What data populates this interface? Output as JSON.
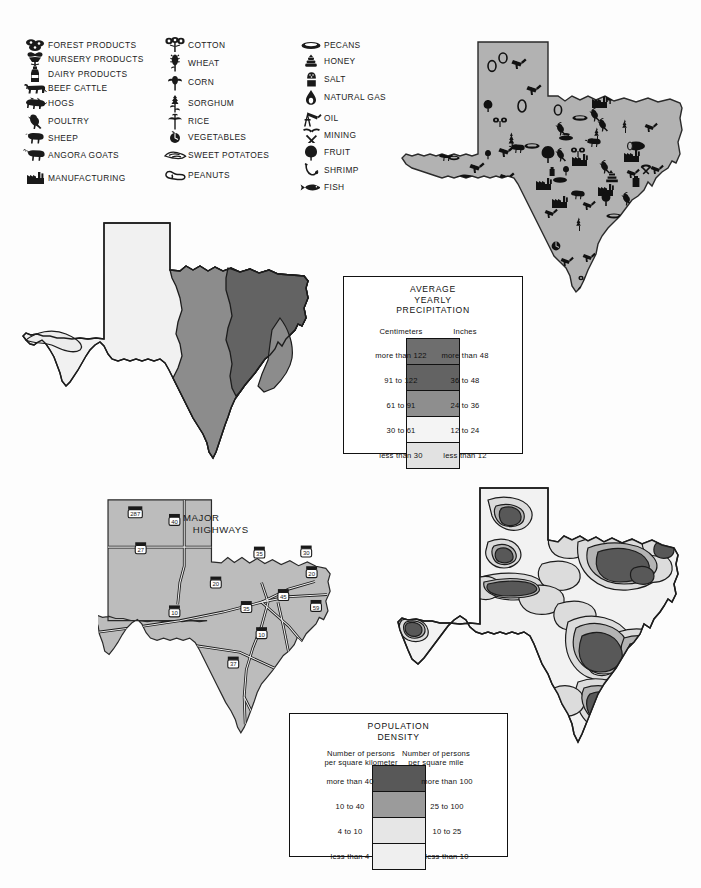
{
  "product_key": {
    "columns": [
      {
        "items": [
          {
            "icon": "forest-products-icon",
            "label": "FOREST PRODUCTS"
          },
          {
            "icon": "nursery-products-icon",
            "label": "NURSERY PRODUCTS"
          },
          {
            "icon": "dairy-products-icon",
            "label": "DAIRY PRODUCTS"
          },
          {
            "icon": "beef-cattle-icon",
            "label": "BEEF CATTLE"
          },
          {
            "icon": "hogs-icon",
            "label": "HOGS"
          },
          {
            "icon": "poultry-icon",
            "label": "POULTRY"
          },
          {
            "icon": "sheep-icon",
            "label": "SHEEP"
          },
          {
            "icon": "angora-goats-icon",
            "label": "ANGORA GOATS"
          },
          {
            "icon": "manufacturing-icon",
            "label": "MANUFACTURING"
          }
        ]
      },
      {
        "items": [
          {
            "icon": "cotton-icon",
            "label": "COTTON"
          },
          {
            "icon": "wheat-icon",
            "label": "WHEAT"
          },
          {
            "icon": "corn-icon",
            "label": "CORN"
          },
          {
            "icon": "sorghum-icon",
            "label": "SORGHUM"
          },
          {
            "icon": "rice-icon",
            "label": "RICE"
          },
          {
            "icon": "vegetables-icon",
            "label": "VEGETABLES"
          },
          {
            "icon": "sweet-potatoes-icon",
            "label": "SWEET POTATOES"
          },
          {
            "icon": "peanuts-icon",
            "label": "PEANUTS"
          }
        ]
      },
      {
        "items": [
          {
            "icon": "pecans-icon",
            "label": "PECANS"
          },
          {
            "icon": "honey-icon",
            "label": "HONEY"
          },
          {
            "icon": "salt-icon",
            "label": "SALT"
          },
          {
            "icon": "natural-gas-icon",
            "label": "NATURAL GAS"
          },
          {
            "icon": "oil-icon",
            "label": "OIL"
          },
          {
            "icon": "mining-icon",
            "label": "MINING"
          },
          {
            "icon": "fruit-icon",
            "label": "FRUIT"
          },
          {
            "icon": "shrimp-icon",
            "label": "SHRIMP"
          },
          {
            "icon": "fish-icon",
            "label": "FISH"
          }
        ]
      }
    ]
  },
  "maps": {
    "products": {
      "name": "texas-products-map",
      "fill": "#b0b0b0"
    },
    "precipitation": {
      "name": "texas-precipitation-map"
    },
    "highways": {
      "name": "texas-major-highways-map",
      "title": "MAJOR\n   HIGHWAYS",
      "fill": "#bdbdbd"
    },
    "population": {
      "name": "texas-population-density-map"
    }
  },
  "precip_legend": {
    "title": "AVERAGE\nYEARLY\nPRECIPITATION",
    "left_header": "Centimeters",
    "right_header": "Inches",
    "rows": [
      {
        "cm": "more than 122",
        "in": "more than 48",
        "color": "#6e6e6e"
      },
      {
        "cm": "91 to 122",
        "in": "36 to 48",
        "color": "#636363"
      },
      {
        "cm": "61 to 91",
        "in": "24 to 36",
        "color": "#8e8e8e"
      },
      {
        "cm": "30 to 61",
        "in": "12 to 24",
        "color": "#f4f4f4"
      },
      {
        "cm": "less than 30",
        "in": "less than 12",
        "color": "#e2e2e2"
      }
    ]
  },
  "pop_legend": {
    "title": "POPULATION\nDENSITY",
    "left_header": "Number of persons\nper square kilometer",
    "right_header": "Number of persons\nper square mile",
    "rows": [
      {
        "km": "more than 40",
        "mi": "more than 100",
        "color": "#585858"
      },
      {
        "km": "10 to 40",
        "mi": "25 to 100",
        "color": "#9b9b9b"
      },
      {
        "km": "4 to 10",
        "mi": "10 to 25",
        "color": "#e6e6e6"
      },
      {
        "km": "less than 4",
        "mi": "less than 10",
        "color": "#efefef"
      }
    ]
  },
  "highway_shields": [
    {
      "label": "287",
      "x": 68,
      "y": 46
    },
    {
      "label": "40",
      "x": 140,
      "y": 60
    },
    {
      "label": "27",
      "x": 78,
      "y": 112
    },
    {
      "label": "20",
      "x": 216,
      "y": 175
    },
    {
      "label": "35",
      "x": 296,
      "y": 120
    },
    {
      "label": "30",
      "x": 382,
      "y": 118
    },
    {
      "label": "20",
      "x": 392,
      "y": 156
    },
    {
      "label": "45",
      "x": 340,
      "y": 198
    },
    {
      "label": "35",
      "x": 272,
      "y": 220
    },
    {
      "label": "59",
      "x": 400,
      "y": 218
    },
    {
      "label": "10",
      "x": 140,
      "y": 228
    },
    {
      "label": "10",
      "x": 300,
      "y": 268
    },
    {
      "label": "37",
      "x": 248,
      "y": 322
    }
  ]
}
